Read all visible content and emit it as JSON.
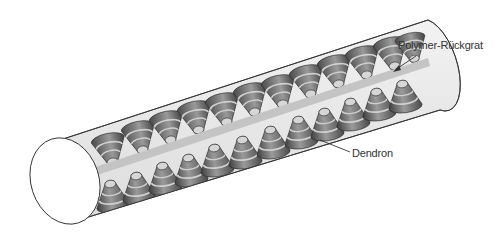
{
  "figure": {
    "labels": {
      "backbone": "Polymer-Rückgrat",
      "dendron": "Dendron"
    },
    "colors": {
      "background": "#ffffff",
      "cylinder_fill": "#e6e6e6",
      "cylinder_outline": "#333333",
      "backbone": "#c4c4c4",
      "dendron_dark": "#5a5a5a",
      "dendron_light": "#b8b8b8",
      "label_text": "#333333"
    },
    "dendron_count": {
      "upper_row": 12,
      "lower_row": 12
    }
  }
}
